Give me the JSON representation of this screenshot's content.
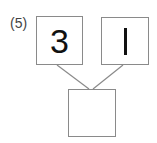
{
  "problem": {
    "label": "(5)",
    "top_left_value": "3",
    "top_right_value": "1",
    "bottom_value": ""
  },
  "colors": {
    "border": "#8a8a8a",
    "text": "#111111",
    "label": "#444444"
  }
}
